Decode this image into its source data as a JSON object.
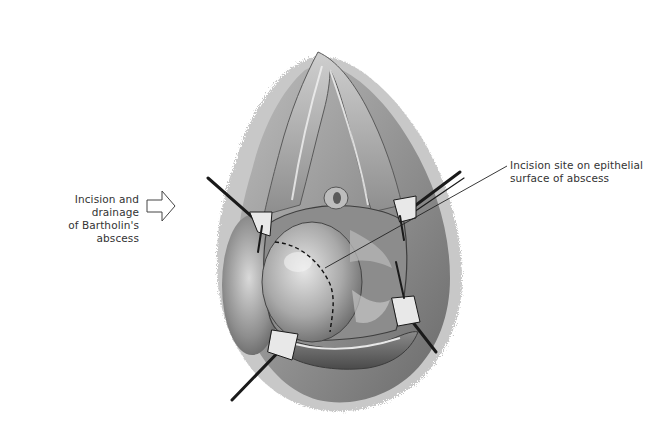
{
  "figure": {
    "subject": "Incision and drainage of Bartholin's abscess",
    "labels": {
      "left": {
        "line1": "Incision and drainage",
        "line2": "of Bartholin's abscess",
        "pointer": "hollow-right-arrow"
      },
      "right": {
        "line1": "Incision site on epithelial",
        "line2": "surface of abscess",
        "pointer": "leader-line"
      }
    },
    "illustration": {
      "style": "grayscale medical drawing",
      "elements": [
        "retracted labia with four retractor hooks",
        "swollen Bartholin's abscess (left side)",
        "dashed incision line on abscess surface",
        "vaginal introitus / urethral meatus"
      ]
    }
  },
  "colors": {
    "background": "#ffffff",
    "text": "#333333",
    "ink": "#1a1a1a",
    "skin_light": "#d8d8d8",
    "skin_mid": "#a8a8a8",
    "skin_dark": "#6e6e6e"
  }
}
